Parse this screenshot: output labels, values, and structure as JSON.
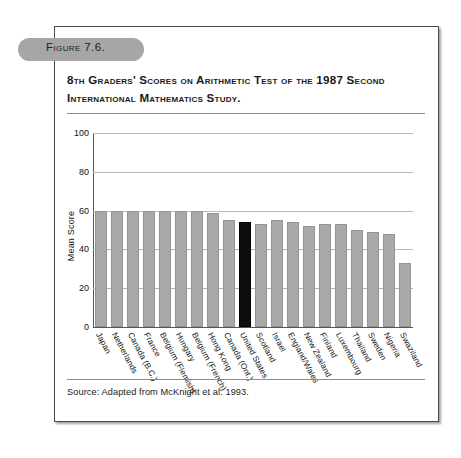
{
  "figure": {
    "tab_label": "Figure 7.6.",
    "title": "8th Graders' Scores on Arithmetic Test of the 1987 Second International Mathematics Study.",
    "source": "Source: Adapted from McKnight et al. 1993."
  },
  "colors": {
    "bar": "#a9a9a9",
    "bar_highlight": "#0d0d0d",
    "gridline": "#b9b9b9",
    "frame_border": "#4a4a4a",
    "tab_background": "#a6a6a6"
  },
  "chart_data": {
    "type": "bar",
    "title": "8th Graders' Scores on Arithmetic Test of the 1987 Second International Mathematics Study.",
    "xlabel": "",
    "ylabel": "Mean Score",
    "ylim": [
      0,
      100
    ],
    "yticks": [
      0,
      20,
      40,
      60,
      80,
      100
    ],
    "ytick_labels": [
      "0",
      "20",
      "40",
      "60",
      "80",
      "100"
    ],
    "grid": true,
    "legend": "none",
    "highlight_category": "United States",
    "categories": [
      "Japan",
      "Netherlands",
      "Canada (B.C.)",
      "France",
      "Belgium (Flemish)",
      "Hungary",
      "Belgium (French)",
      "Hong Kong",
      "Canada (Ont.)",
      "United States",
      "Scotland",
      "Israel",
      "England/Wales",
      "New Zealand",
      "Finland",
      "Luxembourg",
      "Thailand",
      "Sweden",
      "Nigeria",
      "Swaziland"
    ],
    "values": [
      60,
      60,
      60,
      60,
      60,
      60,
      60,
      59,
      55,
      54,
      53,
      55,
      54,
      52,
      53,
      53,
      50,
      49,
      48,
      33
    ]
  }
}
